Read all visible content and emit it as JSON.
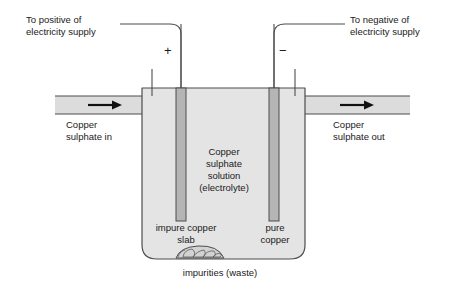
{
  "diagram": {
    "labels": {
      "positive_terminal": "To positive of\nelectricity supply",
      "negative_terminal": "To negative of\nelectricity supply",
      "inlet": "Copper\nsulphate in",
      "outlet": "Copper\nsulphate out",
      "electrolyte": "Copper\nsulphate\nsolution\n(electrolyte)",
      "anode": "impure copper\nslab",
      "cathode": "pure\ncopper",
      "impurities": "impurities (waste)",
      "plus_sign": "+",
      "minus_sign": "−"
    },
    "colors": {
      "stroke": "#4d4d4d",
      "electrolyte_fill": "#e4e4e4",
      "pipe_fill": "#dcdcdc",
      "electrode_fill": "#b5b5b5",
      "impurities_fill": "#d2d2d2",
      "background": "#ffffff",
      "text": "#1a1a1a"
    },
    "flow_arrows": [
      {
        "name": "inlet-flow-arrow",
        "direction": "right"
      },
      {
        "name": "outlet-flow-arrow",
        "direction": "right"
      }
    ]
  }
}
